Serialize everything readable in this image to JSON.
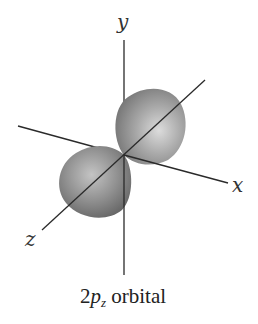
{
  "diagram": {
    "title": "2pz orbital",
    "axes": {
      "x_label": "x",
      "y_label": "y",
      "z_label": "z"
    },
    "caption": {
      "prefix": "2",
      "letter": "p",
      "subscript": "z",
      "suffix": " orbital"
    },
    "colors": {
      "lobe_base": "#8a8a8a",
      "lobe_highlight": "#d6d6d6",
      "axis_line": "#2a2a2a"
    }
  }
}
